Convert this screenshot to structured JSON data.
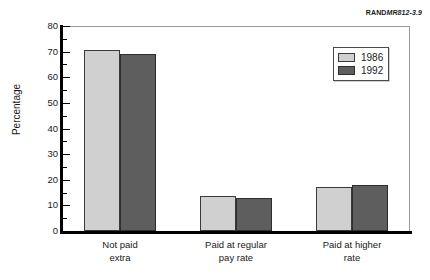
{
  "corner_id": {
    "brand": "RAND",
    "number": "MR812-3.9"
  },
  "chart_data": {
    "type": "bar",
    "title": "",
    "subtitle": "",
    "xlabel": "",
    "ylabel": "Percentage",
    "ylim": [
      0,
      80
    ],
    "ytick_step": 10,
    "yminor_step": 5,
    "grid": false,
    "legend_position": "top-right",
    "categories": [
      "Not paid\nextra",
      "Paid at regular\npay rate",
      "Paid at higher\nrate"
    ],
    "category_lines": [
      [
        "Not paid",
        "extra"
      ],
      [
        "Paid at regular",
        "pay rate"
      ],
      [
        "Paid at higher",
        "rate"
      ]
    ],
    "series": [
      {
        "name": "1986",
        "color": "#d0d0d0",
        "values": [
          70.5,
          13.5,
          17
        ]
      },
      {
        "name": "1992",
        "color": "#5e5e5e",
        "values": [
          69,
          13,
          18
        ]
      }
    ],
    "ytick_labels": [
      "0",
      "10",
      "20",
      "30",
      "40",
      "50",
      "60",
      "70",
      "80"
    ],
    "yminor_labels": [
      "5",
      "15",
      "25",
      "35",
      "45",
      "55",
      "65",
      "75"
    ]
  },
  "colors": {
    "series_1986": "#d0d0d0",
    "series_1992": "#5e5e5e",
    "axis": "#000000",
    "frame": "#9a9a9a",
    "text": "#1a1a1a",
    "background": "#ffffff"
  }
}
